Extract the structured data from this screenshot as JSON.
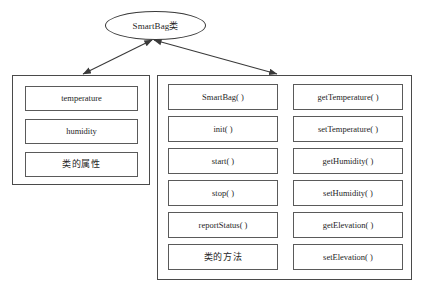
{
  "diagram": {
    "type": "class-diagram",
    "root": {
      "label": "SmartBag类",
      "shape": "ellipse"
    },
    "connectors": [
      {
        "name": "root-to-attributes",
        "style": "double-headed-arrow"
      },
      {
        "name": "root-to-methods",
        "style": "double-headed-arrow"
      }
    ],
    "attributes_group": {
      "name": "attributes",
      "items": [
        {
          "label": "temperature"
        },
        {
          "label": "humidity"
        },
        {
          "label": "类的属性"
        }
      ]
    },
    "methods_group": {
      "name": "methods",
      "columns": [
        {
          "items": [
            {
              "label": "SmartBag( )"
            },
            {
              "label": "init( )"
            },
            {
              "label": "start( )"
            },
            {
              "label": "stop( )"
            },
            {
              "label": "reportStatus( )"
            },
            {
              "label": "类的方法"
            }
          ]
        },
        {
          "items": [
            {
              "label": "getTemperature( )"
            },
            {
              "label": "setTemperature( )"
            },
            {
              "label": "getHumidity( )"
            },
            {
              "label": "setHumidity( )"
            },
            {
              "label": "getElevation( )"
            },
            {
              "label": "setElevation( )"
            }
          ]
        }
      ]
    },
    "colors": {
      "background": "#ffffff",
      "stroke": "#4a4a4a",
      "cell_stroke": "#5a5a5a",
      "text": "#262626"
    }
  }
}
